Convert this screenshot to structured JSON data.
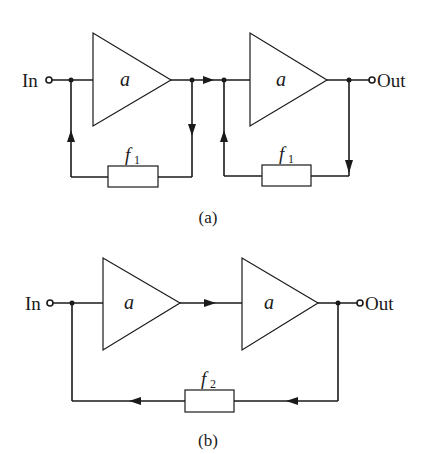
{
  "diagram_a": {
    "caption": "(a)",
    "input_label": "In",
    "output_label": "Out",
    "amp1_label": "a",
    "amp2_label": "a",
    "fb1_label": "f",
    "fb1_sub": "1",
    "fb2_label": "f",
    "fb2_sub": "1"
  },
  "diagram_b": {
    "caption": "(b)",
    "input_label": "In",
    "output_label": "Out",
    "amp1_label": "a",
    "amp2_label": "a",
    "fb_label": "f",
    "fb_sub": "2"
  },
  "colors": {
    "line": "#1a1a1a",
    "background": "#ffffff"
  }
}
